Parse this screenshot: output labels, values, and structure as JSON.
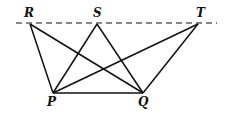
{
  "diagram": {
    "stroke_color": "#111111",
    "parallel_line": {
      "x1": 16,
      "y1": 23,
      "x2": 217,
      "y2": 23,
      "style": "dashed"
    },
    "points": {
      "R": {
        "label": "R",
        "x": 30,
        "y": 24,
        "lx": 24,
        "ly": 17
      },
      "S": {
        "label": "S",
        "x": 97,
        "y": 24,
        "lx": 93,
        "ly": 17
      },
      "T": {
        "label": "T",
        "x": 198,
        "y": 24,
        "lx": 196,
        "ly": 17
      },
      "P": {
        "label": "P",
        "x": 53,
        "y": 93,
        "lx": 47,
        "ly": 106
      },
      "Q": {
        "label": "Q",
        "x": 143,
        "y": 93,
        "lx": 138,
        "ly": 106
      }
    },
    "segments": [
      [
        "P",
        "Q"
      ],
      [
        "R",
        "P"
      ],
      [
        "R",
        "Q"
      ],
      [
        "S",
        "P"
      ],
      [
        "S",
        "Q"
      ],
      [
        "T",
        "P"
      ],
      [
        "T",
        "Q"
      ]
    ]
  }
}
